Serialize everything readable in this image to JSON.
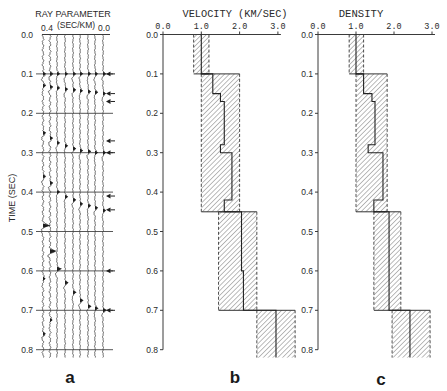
{
  "figure": {
    "panel_labels": [
      "a",
      "b",
      "c"
    ]
  },
  "chart_data": [
    {
      "panel": "a",
      "type": "line",
      "title": "RAY PARAMETER",
      "subtitle": "(SEC/KM)",
      "xlabel": "RAY PARAMETER (SEC/KM)",
      "ylabel": "TIME (SEC)",
      "xlim": [
        0.4,
        0.0
      ],
      "x_tick_labels": [
        "0.4",
        "0.0"
      ],
      "ylim": [
        0.0,
        0.8
      ],
      "y_ticks": [
        0.0,
        0.1,
        0.2,
        0.3,
        0.4,
        0.5,
        0.6,
        0.7,
        0.8
      ],
      "y_tick_labels": [
        "0.0",
        "0.1",
        "0.2",
        "0.3",
        "0.4",
        "0.5",
        "0.6",
        "0.7",
        "0.8"
      ],
      "grid": true,
      "ray_parameters": [
        0.4,
        0.35,
        0.3,
        0.25,
        0.2,
        0.15,
        0.1,
        0.05,
        0.0
      ],
      "events": [
        {
          "name": "event-1",
          "strength": "small",
          "times": [
            0.1,
            0.1,
            0.1,
            0.1,
            0.1,
            0.1,
            0.1,
            0.1,
            0.1
          ]
        },
        {
          "name": "event-2",
          "strength": "small",
          "times": [
            0.13,
            0.133,
            0.136,
            0.139,
            0.141,
            0.143,
            0.145,
            0.147,
            0.15
          ]
        },
        {
          "name": "event-3",
          "strength": "small",
          "times": [
            0.25,
            0.263,
            0.275,
            0.283,
            0.29,
            0.295,
            0.297,
            0.3,
            0.3
          ]
        },
        {
          "name": "event-4",
          "strength": "small",
          "times": [
            0.36,
            0.377,
            0.4,
            0.412,
            0.42,
            0.43,
            0.435,
            0.44,
            0.447
          ]
        },
        {
          "name": "event-5",
          "strength": "large",
          "times": [
            0.485,
            0.55,
            0.595,
            0.63,
            0.655,
            0.675,
            0.69,
            0.695,
            0.7
          ]
        }
      ],
      "extra_events": [
        {
          "trace": 0,
          "time": 0.62
        },
        {
          "trace": 0,
          "time": 0.76
        },
        {
          "trace": 1,
          "time": 0.725
        }
      ],
      "arrow_times": [
        0.1,
        0.15,
        0.17,
        0.27,
        0.3,
        0.41,
        0.445,
        0.6,
        0.7
      ],
      "label": "a"
    },
    {
      "panel": "b",
      "type": "line",
      "title": "VELOCITY (KM/SEC)",
      "xlabel": "VELOCITY (KM/SEC)",
      "ylabel": "TIME (SEC)",
      "xlim": [
        0.0,
        3.0
      ],
      "x_ticks": [
        0.0,
        1.0,
        2.0,
        3.0
      ],
      "x_tick_labels": [
        "0.0",
        "1.0",
        "2.0",
        "3.0"
      ],
      "ylim": [
        0.0,
        0.8
      ],
      "y_ticks": [
        0.0,
        0.1,
        0.2,
        0.3,
        0.4,
        0.5,
        0.6,
        0.7,
        0.8
      ],
      "y_tick_labels": [
        "0.0",
        "0.1",
        "0.2",
        "0.3",
        "0.4",
        "0.5",
        "0.6",
        "0.7",
        "0.8"
      ],
      "grid": false,
      "bounds_layers": [
        {
          "top": 0.0,
          "bottom": 0.1,
          "min": 0.8,
          "max": 1.2
        },
        {
          "top": 0.1,
          "bottom": 0.45,
          "min": 1.0,
          "max": 2.0
        },
        {
          "top": 0.45,
          "bottom": 0.7,
          "min": 1.45,
          "max": 2.45
        },
        {
          "top": 0.7,
          "bottom": 0.82,
          "min": 2.45,
          "max": 3.45
        }
      ],
      "profile": [
        {
          "top": 0.0,
          "bottom": 0.1,
          "value": 1.0
        },
        {
          "top": 0.1,
          "bottom": 0.15,
          "value": 1.3
        },
        {
          "top": 0.15,
          "bottom": 0.17,
          "value": 1.5
        },
        {
          "top": 0.17,
          "bottom": 0.28,
          "value": 1.6
        },
        {
          "top": 0.28,
          "bottom": 0.3,
          "value": 1.5
        },
        {
          "top": 0.3,
          "bottom": 0.42,
          "value": 1.8
        },
        {
          "top": 0.42,
          "bottom": 0.45,
          "value": 1.6
        },
        {
          "top": 0.45,
          "bottom": 0.6,
          "value": 2.05
        },
        {
          "top": 0.6,
          "bottom": 0.7,
          "value": 2.1
        },
        {
          "top": 0.7,
          "bottom": 0.82,
          "value": 2.95
        }
      ],
      "label": "b"
    },
    {
      "panel": "c",
      "type": "line",
      "title": "DENSITY",
      "xlabel": "DENSITY",
      "ylabel": "TIME (SEC)",
      "xlim": [
        0.0,
        3.0
      ],
      "x_ticks": [
        0.0,
        1.0,
        2.0,
        3.0
      ],
      "x_tick_labels": [
        "0.0",
        "1.0",
        "2.0",
        "3.0"
      ],
      "ylim": [
        0.0,
        0.8
      ],
      "y_ticks": [
        0.0,
        0.1,
        0.2,
        0.3,
        0.4,
        0.5,
        0.6,
        0.7,
        0.8
      ],
      "y_tick_labels": [
        "0.0",
        "0.1",
        "0.2",
        "0.3",
        "0.4",
        "0.5",
        "0.6",
        "0.7",
        "0.8"
      ],
      "grid": false,
      "bounds_layers": [
        {
          "top": 0.0,
          "bottom": 0.1,
          "min": 0.82,
          "max": 1.2
        },
        {
          "top": 0.1,
          "bottom": 0.45,
          "min": 1.0,
          "max": 1.82
        },
        {
          "top": 0.45,
          "bottom": 0.7,
          "min": 1.47,
          "max": 2.18
        },
        {
          "top": 0.7,
          "bottom": 0.82,
          "min": 1.95,
          "max": 2.95
        }
      ],
      "profile": [
        {
          "top": 0.0,
          "bottom": 0.1,
          "value": 1.0
        },
        {
          "top": 0.1,
          "bottom": 0.15,
          "value": 1.2
        },
        {
          "top": 0.15,
          "bottom": 0.17,
          "value": 1.42
        },
        {
          "top": 0.17,
          "bottom": 0.28,
          "value": 1.5
        },
        {
          "top": 0.28,
          "bottom": 0.3,
          "value": 1.32
        },
        {
          "top": 0.3,
          "bottom": 0.42,
          "value": 1.71
        },
        {
          "top": 0.42,
          "bottom": 0.45,
          "value": 1.47
        },
        {
          "top": 0.45,
          "bottom": 0.7,
          "value": 1.87
        },
        {
          "top": 0.7,
          "bottom": 0.82,
          "value": 2.42
        }
      ],
      "label": "c"
    }
  ]
}
